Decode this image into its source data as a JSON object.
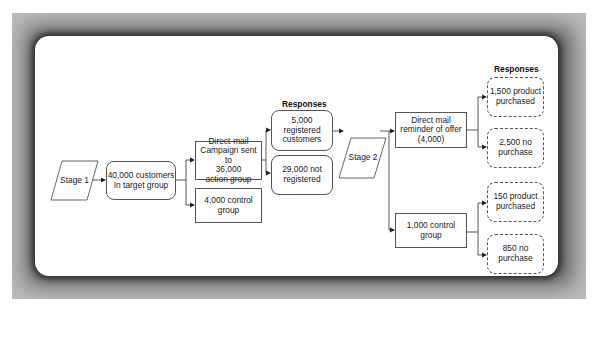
{
  "diagram": {
    "type": "flowchart",
    "stage1": {
      "label": "Stage 1"
    },
    "target_group": {
      "label": "40,000 customers\nIn target group"
    },
    "action_group": {
      "label": "Direct-mail\nCampaign sent to\n36,000\naction group"
    },
    "control_group_1": {
      "label": "4,000 control\ngroup"
    },
    "responses_1": {
      "label": "Responses"
    },
    "registered": {
      "label": "5,000 registered\ncustomers"
    },
    "not_registered": {
      "label": "29,000 not\nregistered"
    },
    "stage2": {
      "label": "Stage 2"
    },
    "reminder": {
      "label": "Direct mail\nreminder of offer\n(4,000)"
    },
    "control_group_2": {
      "label": "1,000 control\ngroup"
    },
    "responses_2": {
      "label": "Responses"
    },
    "reminder_purchased": {
      "label": "1,500 product\npurchased"
    },
    "reminder_no_purchase": {
      "label": "2,500 no\npurchase"
    },
    "control_purchased": {
      "label": "150 product\npurchased"
    },
    "control_no_purchase": {
      "label": "850 no\npurchase"
    },
    "edges": [
      [
        "Stage 1",
        "40,000 customers In target group"
      ],
      [
        "40,000 customers In target group",
        "Direct-mail Campaign sent to 36,000 action group"
      ],
      [
        "40,000 customers In target group",
        "4,000 control group"
      ],
      [
        "Direct-mail Campaign sent to 36,000 action group",
        "5,000 registered customers"
      ],
      [
        "Direct-mail Campaign sent to 36,000 action group",
        "29,000 not registered"
      ],
      [
        "5,000 registered customers",
        "Stage 2"
      ],
      [
        "Stage 2",
        "Direct mail reminder of offer (4,000)"
      ],
      [
        "Stage 2",
        "1,000 control group"
      ],
      [
        "Direct mail reminder of offer (4,000)",
        "1,500 product purchased"
      ],
      [
        "Direct mail reminder of offer (4,000)",
        "2,500 no purchase"
      ],
      [
        "1,000 control group",
        "150 product purchased"
      ],
      [
        "1,000 control group",
        "850 no purchase"
      ]
    ]
  },
  "colors": {
    "frame": "#5a5a5a",
    "card": "#ffffff",
    "stroke": "#555555",
    "text": "#222222"
  }
}
